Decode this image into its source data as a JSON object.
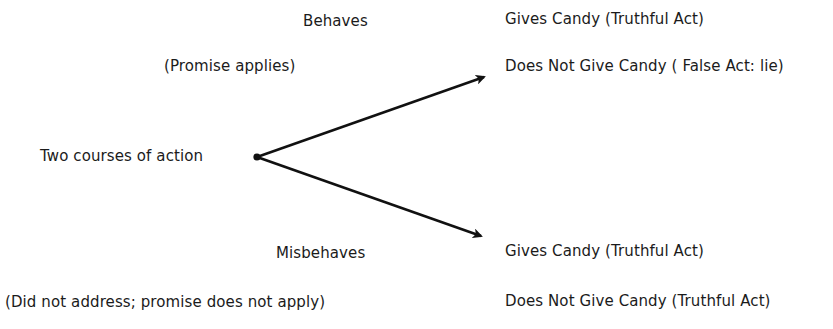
{
  "diagram": {
    "type": "decision-tree",
    "root": {
      "label": "Two courses of action"
    },
    "branches": [
      {
        "condition": "Behaves",
        "note": "(Promise applies)",
        "outcomes": [
          "Gives Candy (Truthful Act)",
          "Does Not Give Candy ( False Act: lie)"
        ]
      },
      {
        "condition": "Misbehaves",
        "note": "(Did not address; promise does not apply)",
        "outcomes": [
          "Gives Candy (Truthful Act)",
          "Does Not Give Candy (Truthful Act)"
        ]
      }
    ],
    "colors": {
      "background": "#ffffff",
      "text": "#1b1b1b",
      "arrow": "#111111"
    }
  }
}
